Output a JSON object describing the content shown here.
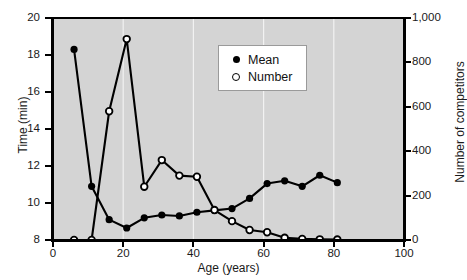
{
  "chart_data": {
    "type": "line",
    "title": "",
    "xlabel": "Age (years)",
    "ylabel": "Time (min)",
    "y2label": "Number of competitors",
    "xlim": [
      0,
      100
    ],
    "ylim": [
      8,
      20
    ],
    "y2lim": [
      0,
      1000
    ],
    "grid": true,
    "legend_position": "upper-center",
    "x_ticks": [
      "0",
      "20",
      "40",
      "60",
      "80",
      "100"
    ],
    "x_tick_values": [
      0,
      20,
      40,
      60,
      80,
      100
    ],
    "y_ticks": [
      "8",
      "10",
      "12",
      "14",
      "16",
      "18",
      "20"
    ],
    "y_tick_values": [
      8,
      10,
      12,
      14,
      16,
      18,
      20
    ],
    "y2_ticks": [
      "0",
      "200",
      "400",
      "600",
      "800",
      "1,000"
    ],
    "y2_tick_values": [
      0,
      200,
      400,
      600,
      800,
      1000
    ],
    "x": [
      6,
      11,
      16,
      21,
      26,
      31,
      36,
      41,
      46,
      51,
      56,
      61,
      66,
      71,
      76,
      81
    ],
    "series": [
      {
        "name": "Mean",
        "axis": "left",
        "marker": "filled-circle",
        "values": [
          18.3,
          10.9,
          9.1,
          8.65,
          9.2,
          9.35,
          9.3,
          9.5,
          9.6,
          9.7,
          10.25,
          11.05,
          11.2,
          10.9,
          11.5,
          11.1
        ]
      },
      {
        "name": "Number",
        "axis": "right",
        "marker": "open-circle",
        "values": [
          0,
          0,
          580,
          905,
          240,
          360,
          290,
          285,
          135,
          85,
          45,
          35,
          10,
          5,
          3,
          2
        ]
      }
    ]
  },
  "legend": {
    "items": [
      {
        "label": "Mean",
        "marker": "filled-circle"
      },
      {
        "label": "Number",
        "marker": "open-circle"
      }
    ]
  },
  "colors": {
    "plot_background": "#d4d4d4",
    "line": "#000000",
    "grid": "#f2f2f2",
    "text": "#1a1a1a",
    "figure_background": "#ffffff"
  }
}
